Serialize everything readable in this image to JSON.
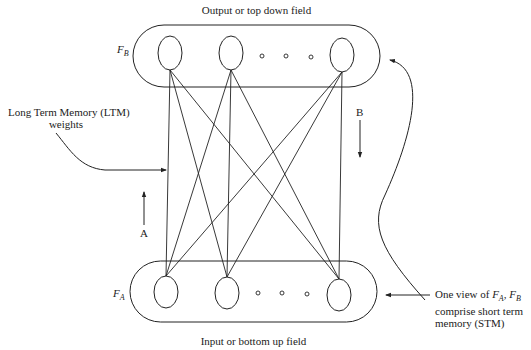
{
  "diagram": {
    "top_field": {
      "caption": "Output or top down field",
      "name_main": "F",
      "name_sub": "B",
      "neurons": 3,
      "ellipsis": "o o o"
    },
    "bottom_field": {
      "caption": "Input or bottom up field",
      "name_main": "F",
      "name_sub": "A",
      "neurons": 3,
      "ellipsis": "o o o"
    },
    "ltm_label": {
      "line1": "Long Term Memory (LTM)",
      "line2": "weights"
    },
    "arrow_a_label": "A",
    "arrow_b_label": "B",
    "stm_label": {
      "line1_prefix": "One view of ",
      "fa_main": "F",
      "fa_sub": "A",
      "sep": ", ",
      "fb_main": "F",
      "fb_sub": "B",
      "line2": "comprise short term",
      "line3": "memory (STM)"
    },
    "colors": {
      "stroke": "#222222",
      "background": "#ffffff"
    }
  }
}
